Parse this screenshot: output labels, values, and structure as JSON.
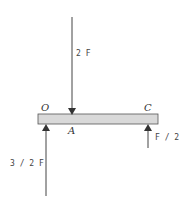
{
  "diagram": {
    "type": "free-body-diagram",
    "beam": {
      "fill": "#d9d9d9",
      "stroke": "#444444"
    },
    "points": [
      {
        "id": "O",
        "label": "O"
      },
      {
        "id": "A",
        "label": "A"
      },
      {
        "id": "C",
        "label": "C"
      }
    ],
    "forces": [
      {
        "id": "f-2F",
        "label": "2 F",
        "direction": "down",
        "at": "A"
      },
      {
        "id": "f-3-2F",
        "label": "3 / 2  F",
        "direction": "up",
        "at": "O"
      },
      {
        "id": "f-F2",
        "label": "F / 2",
        "direction": "up",
        "at": "C"
      }
    ],
    "colors": {
      "line": "#444444",
      "beam": "#d9d9d9"
    }
  }
}
